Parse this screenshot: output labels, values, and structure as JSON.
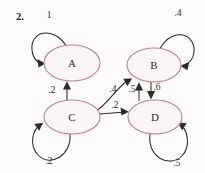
{
  "figure": {
    "problem_number": "2.",
    "type": "state-transition-diagram",
    "node_stroke_color": "#c4808f",
    "node_fill_color": "#fdf6f7",
    "edge_color": "#2b2b2b",
    "background_color": "#fdfcfb"
  },
  "nodes": [
    {
      "id": "A",
      "label": "A",
      "cx": 72,
      "cy": 63,
      "rx": 28,
      "ry": 18
    },
    {
      "id": "B",
      "label": "B",
      "cx": 154,
      "cy": 65,
      "rx": 27,
      "ry": 17
    },
    {
      "id": "C",
      "label": "C",
      "cx": 72,
      "cy": 117,
      "rx": 28,
      "ry": 17
    },
    {
      "id": "D",
      "label": "D",
      "cx": 155,
      "cy": 117,
      "rx": 27,
      "ry": 17
    }
  ],
  "edges": [
    {
      "id": "A-A",
      "from": "A",
      "to": "A",
      "label": "1",
      "label_x": 49,
      "label_y": 15,
      "kind": "self-loop",
      "direction": "upper-left"
    },
    {
      "id": "B-B",
      "from": "B",
      "to": "B",
      "label": ".4",
      "label_x": 178,
      "label_y": 13,
      "kind": "self-loop",
      "direction": "upper-right"
    },
    {
      "id": "C-A",
      "from": "C",
      "to": "A",
      "label": ".2",
      "label_x": 52,
      "label_y": 90,
      "kind": "straight",
      "direction": "up"
    },
    {
      "id": "C-B",
      "from": "C",
      "to": "B",
      "label": ".4",
      "label_x": 113,
      "label_y": 89,
      "kind": "curved",
      "direction": "up-right"
    },
    {
      "id": "C-D",
      "from": "C",
      "to": "D",
      "label": ".2",
      "label_x": 115,
      "label_y": 105,
      "kind": "straight",
      "direction": "right"
    },
    {
      "id": "D-B",
      "from": "D",
      "to": "B",
      "label": ".5",
      "label_x": 132,
      "label_y": 89,
      "kind": "straight",
      "direction": "up"
    },
    {
      "id": "B-D",
      "from": "B",
      "to": "D",
      "label": ".6",
      "label_x": 157,
      "label_y": 87,
      "kind": "straight",
      "direction": "down"
    },
    {
      "id": "C-C",
      "from": "C",
      "to": "C",
      "label": ".2",
      "label_x": 49,
      "label_y": 161,
      "kind": "self-loop",
      "direction": "lower-left"
    },
    {
      "id": "D-D",
      "from": "D",
      "to": "D",
      "label": ".5",
      "label_x": 177,
      "label_y": 163,
      "kind": "self-loop",
      "direction": "lower-right"
    }
  ]
}
